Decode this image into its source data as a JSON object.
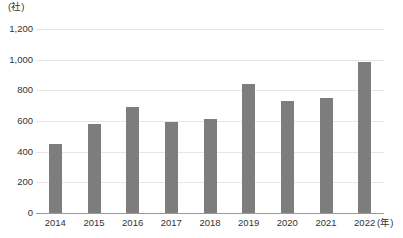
{
  "chart_data": {
    "type": "bar",
    "title": "",
    "subtitle": "",
    "xlabel": "(年)",
    "ylabel": "(社)",
    "categories": [
      "2014",
      "2015",
      "2016",
      "2017",
      "2018",
      "2019",
      "2020",
      "2021",
      "2022"
    ],
    "values": [
      450,
      580,
      690,
      595,
      610,
      840,
      730,
      750,
      985
    ],
    "series": [
      {
        "name": "",
        "values": [
          450,
          580,
          690,
          595,
          610,
          840,
          730,
          750,
          985
        ]
      }
    ],
    "ylim": [
      0,
      1200
    ],
    "ytick_values": [
      0,
      200,
      400,
      600,
      800,
      1000,
      1200
    ],
    "ytick_labels": [
      "0",
      "200",
      "400",
      "600",
      "800",
      "1,000",
      "1,200"
    ],
    "grid": true,
    "legend": false,
    "legend_position": "none",
    "annotations": [],
    "bar_color": "#7d7d7d",
    "gridline_color": "#e6e6e6",
    "axis_color": "#9a9a9a",
    "text_color": "#333333",
    "background_color": "#ffffff"
  }
}
